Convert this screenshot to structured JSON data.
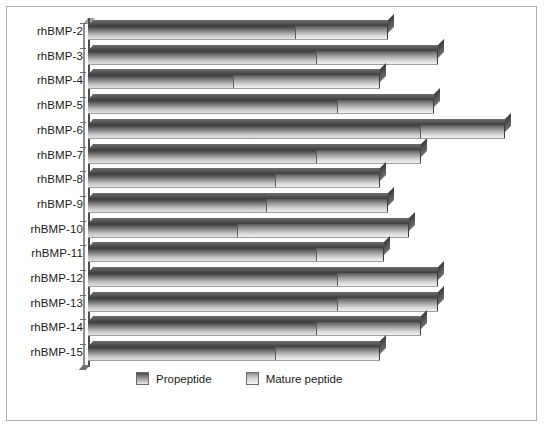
{
  "chart_data": {
    "type": "bar",
    "orientation": "horizontal",
    "stacked": true,
    "title": "",
    "subtitle": "",
    "xlabel": "",
    "ylabel": "",
    "grid": false,
    "xlim": [
      0,
      102
    ],
    "xticks_visible": false,
    "legend_position": "bottom-center",
    "categories": [
      "rhBMP-2",
      "rhBMP-3",
      "rhBMP-4",
      "rhBMP-5",
      "rhBMP-6",
      "rhBMP-7",
      "rhBMP-8",
      "rhBMP-9",
      "rhBMP-10",
      "rhBMP-11",
      "rhBMP-12",
      "rhBMP-13",
      "rhBMP-14",
      "rhBMP-15"
    ],
    "series": [
      {
        "name": "Propeptide",
        "color": "#8e8e8e",
        "values": [
          50,
          55,
          35,
          60,
          80,
          55,
          45,
          43,
          36,
          55,
          60,
          60,
          55,
          45
        ]
      },
      {
        "name": "Mature peptide",
        "color": "#d2d2d2",
        "values": [
          22,
          29,
          35,
          23,
          20,
          25,
          25,
          29,
          41,
          16,
          24,
          24,
          25,
          25
        ]
      }
    ],
    "totals": [
      72,
      84,
      70,
      83,
      100,
      80,
      70,
      72,
      77,
      71,
      84,
      84,
      80,
      70
    ]
  },
  "legend": {
    "items": [
      {
        "label": "Propeptide",
        "swatch": "pro"
      },
      {
        "label": "Mature peptide",
        "swatch": "mat"
      }
    ]
  },
  "colors": {
    "frame_border": "#adadad",
    "axis": "#4d4d4d",
    "background": "#ffffff",
    "text": "#1a1a1a"
  }
}
